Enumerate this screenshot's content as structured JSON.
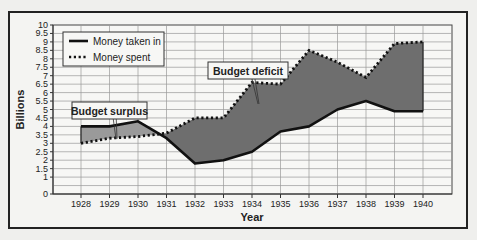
{
  "chart_data": {
    "type": "line",
    "title": "",
    "xlabel": "Year",
    "ylabel": "Billions",
    "ylim": [
      0,
      10
    ],
    "yticks": [
      "0",
      "1",
      "1.5",
      "2",
      "2.5",
      "3",
      "3.5",
      "4",
      "4.5",
      "5",
      "5.5",
      "6",
      "6.5",
      "7",
      "7.5",
      "8",
      "8.5",
      "9",
      "9.5",
      "10"
    ],
    "categories": [
      "1928",
      "1929",
      "1930",
      "1931",
      "1932",
      "1933",
      "1934",
      "1935",
      "1936",
      "1937",
      "1938",
      "1939",
      "1940"
    ],
    "series": [
      {
        "name": "Money taken in",
        "style": "solid",
        "values": [
          4.0,
          4.0,
          4.3,
          3.3,
          1.8,
          2.0,
          2.5,
          3.7,
          4.0,
          5.0,
          5.5,
          4.9,
          4.9
        ]
      },
      {
        "name": "Money spent",
        "style": "dotted",
        "values": [
          3.0,
          3.3,
          3.4,
          3.6,
          4.5,
          4.5,
          6.6,
          6.5,
          8.5,
          7.8,
          6.9,
          8.9,
          9.0
        ]
      }
    ],
    "legend": {
      "position": "top-left",
      "entries": [
        "Money taken in",
        "Money spent"
      ]
    },
    "annotations": [
      {
        "text": "Budget surplus",
        "points_to": "1929"
      },
      {
        "text": "Budget deficit",
        "points_to": "1934"
      }
    ],
    "grid": true,
    "fill_color": "#6e6e6e",
    "surplus_fill_color": "#9a9a9a"
  }
}
